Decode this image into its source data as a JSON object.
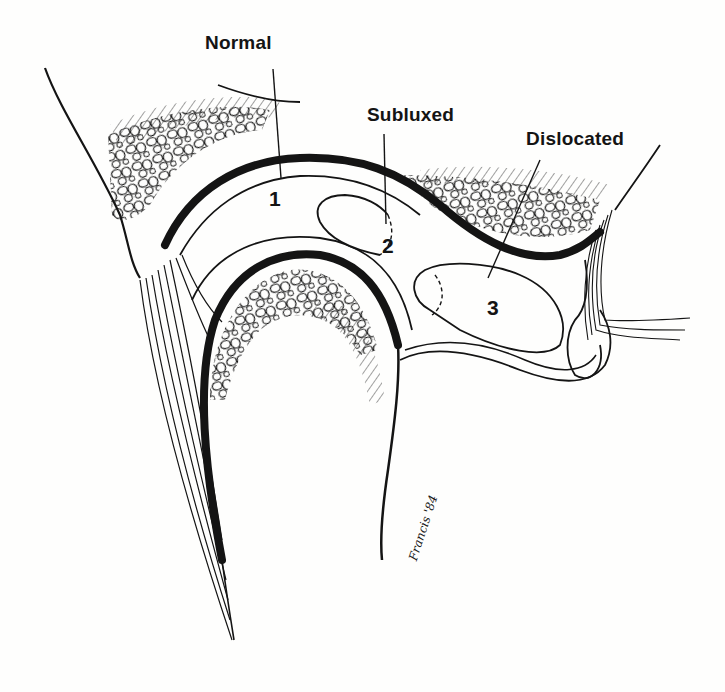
{
  "figure": {
    "ink_color": "#141414",
    "background_color": "#fefefd",
    "labels": {
      "normal": "Normal",
      "subluxed": "Subluxed",
      "dislocated": "Dislocated"
    },
    "position_numbers": {
      "one": "1",
      "two": "2",
      "three": "3"
    },
    "signature": "Francis '84"
  }
}
